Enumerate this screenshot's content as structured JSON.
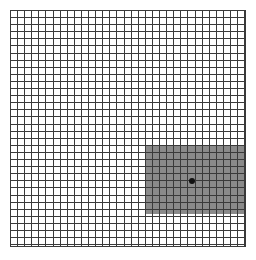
{
  "figure": {
    "name": "amsler-grid",
    "background_color": "#ffffff",
    "width": 256,
    "height": 260
  },
  "chart_data": {
    "type": "heatmap",
    "subtitle": "",
    "xlabel": "",
    "ylabel": "",
    "grid": true,
    "legend_position": "none",
    "plot_area": {
      "left": 10,
      "top": 10,
      "width": 236,
      "height": 237,
      "line_color": "#3a3a3a",
      "line_width_px": 1,
      "cell_size_px": 7.1,
      "columns": 33,
      "rows": 33,
      "background_color": "#ffffff",
      "border_color": "#3a3a3a"
    },
    "categories": [
      "upper-left",
      "upper-right",
      "lower-left",
      "lower-right"
    ],
    "values": [
      0,
      0,
      0,
      1
    ],
    "regions": [
      {
        "name": "scotoma-shaded-region",
        "label": "shaded quadrant",
        "fill_color": "#8a8a8a",
        "opacity": 1,
        "x": 135,
        "y": 135,
        "width": 101,
        "height": 69,
        "grid_columns_span": [
          19,
          33
        ],
        "grid_rows_span": [
          19,
          29
        ]
      }
    ],
    "points": [
      {
        "name": "fixation-point",
        "label": "central fixation dot",
        "x": 182,
        "y": 171,
        "diameter_px": 6,
        "color": "#111111"
      }
    ],
    "annotations": []
  }
}
